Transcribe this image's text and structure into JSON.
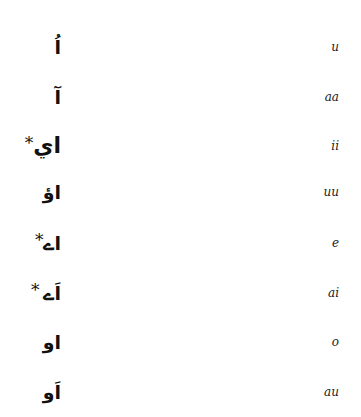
{
  "vowel_table": {
    "rows": [
      {
        "urdu": "اُ",
        "star_left": "",
        "star_right": "",
        "transliteration": "u"
      },
      {
        "urdu": "آ",
        "star_left": "",
        "star_right": "",
        "transliteration": "aa"
      },
      {
        "urdu": "اي",
        "star_left": "*",
        "star_right": "",
        "transliteration": "ii"
      },
      {
        "urdu": "اؤ",
        "star_left": "",
        "star_right": "",
        "transliteration": "uu"
      },
      {
        "urdu": "اے",
        "star_left": "*",
        "star_right": "",
        "transliteration": "e"
      },
      {
        "urdu": "اَے",
        "star_left": "* ",
        "star_right": "",
        "transliteration": "ai"
      },
      {
        "urdu": "او",
        "star_left": "",
        "star_right": "",
        "transliteration": "o"
      },
      {
        "urdu": "اَو",
        "star_left": "",
        "star_right": "",
        "transliteration": "au"
      }
    ]
  }
}
